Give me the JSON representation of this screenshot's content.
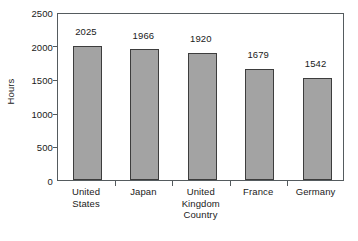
{
  "chart_data": {
    "type": "bar",
    "title": "",
    "xlabel": "Country",
    "ylabel": "Hours",
    "categories": [
      "United States",
      "Japan",
      "United Kingdom",
      "France",
      "Germany"
    ],
    "category_lines": [
      [
        "United",
        "States"
      ],
      [
        "Japan"
      ],
      [
        "United",
        "Kingdom"
      ],
      [
        "France"
      ],
      [
        "Germany"
      ]
    ],
    "values": [
      2025,
      1966,
      1920,
      1679,
      1542
    ],
    "value_labels": [
      "2025",
      "1966",
      "1920",
      "1679",
      "1542"
    ],
    "ylim": [
      0,
      2500
    ],
    "yticks": [
      0,
      500,
      1000,
      1500,
      2000,
      2500
    ],
    "ytick_labels": [
      "0",
      "500",
      "1000",
      "1500",
      "2000",
      "2500"
    ],
    "grid": false,
    "legend": false,
    "legend_position": "none",
    "bar_color": "#a3a3a3",
    "bar_edge_color": "#3d3d3d",
    "axis_color": "#555b5e",
    "text_color": "#1a1a1a",
    "background": "#ffffff",
    "data_labels_shown": true
  }
}
